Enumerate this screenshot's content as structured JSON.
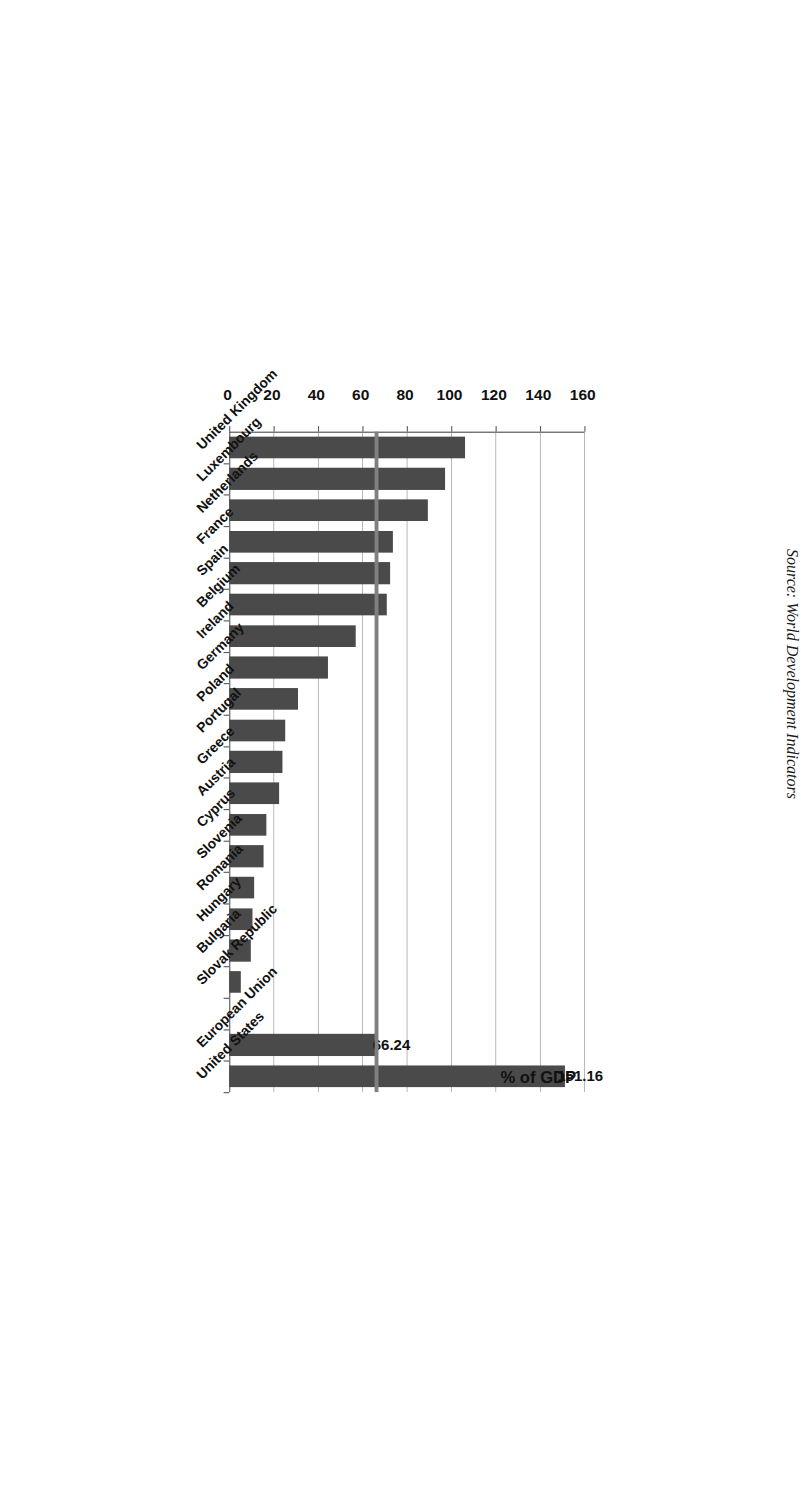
{
  "chart_data": {
    "type": "bar",
    "orientation": "horizontal",
    "title": "",
    "xlabel": "",
    "ylabel": "% of GDP",
    "axis_title": "% of GDP",
    "ylim": [
      0,
      160
    ],
    "ticks": [
      0,
      20,
      40,
      60,
      80,
      100,
      120,
      140,
      160
    ],
    "tick_labels": [
      "0",
      "20",
      "40",
      "60",
      "80",
      "100",
      "120",
      "140",
      "160"
    ],
    "grid": true,
    "legend": "none",
    "bar_color": "#4a4a4a",
    "reference_line": {
      "label": "66.24",
      "value": 66.24,
      "color": "#808080"
    },
    "categories": [
      "United Kingdom",
      "Luxembourg",
      "Netherlands",
      "France",
      "Spain",
      "Belgium",
      "Ireland",
      "Germany",
      "Poland",
      "Portugal",
      "Greece",
      "Austria",
      "Cyprus",
      "Slovenia",
      "Romania",
      "Hungary",
      "Bulgaria",
      "Slovak Republic",
      "",
      "European Union",
      "United States"
    ],
    "values": [
      106.2,
      97.3,
      89.5,
      73.7,
      72.5,
      71.0,
      57.0,
      44.5,
      31.0,
      25.3,
      24.0,
      22.4,
      16.8,
      15.6,
      11.3,
      10.6,
      9.8,
      5.3,
      0,
      66.24,
      151.16
    ],
    "data_labels": {
      "European Union": "66.24",
      "United States": "151.16"
    },
    "annotations": [
      "151.16",
      "66.24"
    ]
  },
  "source_note": "Source: World Development Indicators"
}
